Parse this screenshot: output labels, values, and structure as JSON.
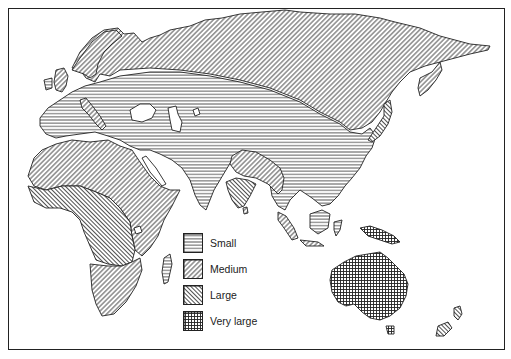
{
  "map": {
    "type": "thematic choropleth (hatched)",
    "region": "Eastern Hemisphere: Europe, Africa, Asia, Australia, Oceania",
    "regions": [
      {
        "name": "Northern Eurasia (Scandinavia, Siberia, Manchuria, Kamchatka)",
        "category": "Medium"
      },
      {
        "name": "Central Eurasia (Europe, Central Asia, China, Middle East)",
        "category": "Small"
      },
      {
        "name": "North Africa / Sahara / East Africa",
        "category": "Medium"
      },
      {
        "name": "West & Central Africa (rainforest belt)",
        "category": "Large"
      },
      {
        "name": "Southern Africa",
        "category": "Medium"
      },
      {
        "name": "Madagascar",
        "category": "Small"
      },
      {
        "name": "Indian Subcontinent core (Ganges)",
        "category": "Medium"
      },
      {
        "name": "Southern India",
        "category": "Large"
      },
      {
        "name": "Southeast Asia mainland",
        "category": "Small"
      },
      {
        "name": "Malay Peninsula / Sumatra / Java",
        "category": "Medium"
      },
      {
        "name": "Borneo",
        "category": "Small"
      },
      {
        "name": "New Guinea",
        "category": "Very large"
      },
      {
        "name": "Australia",
        "category": "Very large"
      },
      {
        "name": "Tasmania",
        "category": "Very large"
      },
      {
        "name": "New Zealand",
        "category": "Large"
      },
      {
        "name": "Japan",
        "category": "Large"
      },
      {
        "name": "British Isles",
        "category": "Medium"
      },
      {
        "name": "Italy",
        "category": "Medium"
      }
    ]
  },
  "legend": {
    "items": [
      {
        "label": "Small",
        "pattern": "horizontal-lines"
      },
      {
        "label": "Medium",
        "pattern": "diagonal-backslash"
      },
      {
        "label": "Large",
        "pattern": "diagonal-slash"
      },
      {
        "label": "Very large",
        "pattern": "crosshatch-grid"
      }
    ]
  },
  "colors": {
    "ink": "#222222",
    "paper": "#ffffff"
  }
}
